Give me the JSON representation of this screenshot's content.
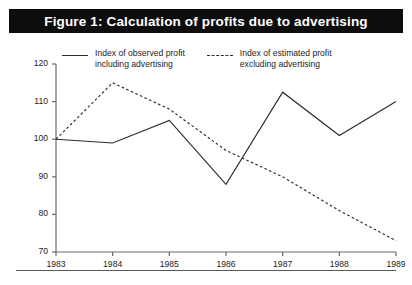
{
  "title": "Figure 1: Calculation of profits due to advertising",
  "colors": {
    "title_bar_background": "#0d0d0d",
    "title_text": "#ffffff",
    "axis": "#6b6b6b",
    "observed_line": "#2b2b2b",
    "estimated_line": "#2b2b2b",
    "page_background": "#ffffff",
    "rule": "#5a5a5a"
  },
  "legend": {
    "entries": [
      {
        "style": "solid",
        "label": "Index of observed profit\ninclulding advertising",
        "label_text": "Index of observed profit\nincluding advertising"
      },
      {
        "style": "dashed",
        "label": "Index of estimated profit\nexcluding advertising",
        "label_text": "Index of estimated profit\nexcluding advertising"
      }
    ]
  },
  "chart_data": {
    "type": "line",
    "title": "Figure 1: Calculation of profits due to advertising",
    "xlabel": "",
    "ylabel": "",
    "x": [
      1983,
      1984,
      1985,
      1986,
      1987,
      1988,
      1989
    ],
    "categories": [
      "1983",
      "1984",
      "1985",
      "1986",
      "1987",
      "1988",
      "1989"
    ],
    "xtick_labels": [
      "1983",
      "1984",
      "1985",
      "1986",
      "1987",
      "1988",
      "1989"
    ],
    "ytick_labels": [
      "70",
      "80",
      "90",
      "100",
      "110",
      "120"
    ],
    "yticks": [
      70,
      80,
      90,
      100,
      110,
      120
    ],
    "ylim": [
      70,
      120
    ],
    "xlim": [
      1983,
      1989
    ],
    "grid": false,
    "legend_position": "top",
    "series": [
      {
        "name": "Index of observed profit including advertising",
        "style": "solid",
        "values": [
          100,
          99,
          105,
          88,
          112.5,
          101,
          110
        ]
      },
      {
        "name": "Index of estimated profit excluding advertising",
        "style": "dashed",
        "values": [
          100,
          115,
          108,
          97,
          90,
          81,
          73
        ]
      }
    ]
  }
}
